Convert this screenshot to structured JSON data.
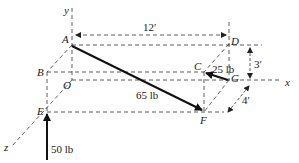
{
  "figure": {
    "points": {
      "A": "A",
      "B": "B",
      "C": "C",
      "D": "D",
      "E": "E",
      "F": "F",
      "G": "G",
      "O": "O"
    },
    "axes": {
      "x": "x",
      "y": "y",
      "z": "z"
    },
    "dimensions": {
      "width": "12′",
      "height": "3′",
      "depth": "4′"
    },
    "forces": {
      "AF": "65 lb",
      "GC": "25 lb",
      "E_up": "50 lb"
    },
    "colors": {
      "ink": "#111111",
      "background": "#ffffff"
    }
  }
}
